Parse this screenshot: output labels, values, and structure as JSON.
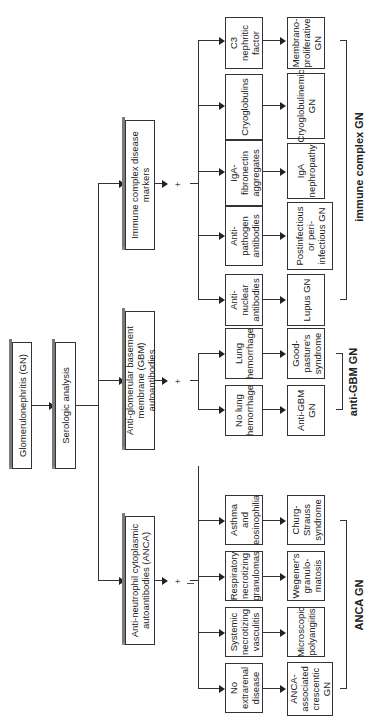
{
  "root": {
    "label": "Glomerulonephritis (GN)"
  },
  "step": {
    "label": "Serologic analysis"
  },
  "categories": [
    {
      "label": "Anti-neutrophil cytoplasmic autoantibodies (ANCA)"
    },
    {
      "label": "Anti-glomerular basement membrane (GBM) autoantibodies"
    },
    {
      "label": "Immune complex disease markers"
    }
  ],
  "plus_symbol": "+",
  "anca": {
    "findings": [
      "No extrarenal disease",
      "Systemic necrotizing vasculitis",
      "Respiratory necrotizing granulomas",
      "Asthma and eosinophilia"
    ],
    "diagnoses": [
      "ANCA-associated crescentic GN",
      "Microscopic polyangiitis",
      "Wegener's granulo-matosis",
      "Churg-Strauss syndrome"
    ],
    "group_label": "ANCA GN"
  },
  "gbm": {
    "findings": [
      "No lung hemorrhage",
      "Lung hemorrhage"
    ],
    "diagnoses": [
      "Anti-GBM GN",
      "Good-pasture's syndrome"
    ],
    "group_label": "anti-GBM GN"
  },
  "immune": {
    "findings": [
      "Anti-nuclear antibodies",
      "Anti-pathogen antibodies",
      "IgA-fibronectin aggregates",
      "Cryoglobulins",
      "C3 nephritic factor"
    ],
    "diagnoses": [
      "Lupus GN",
      "Postinfectious or peri-infectious GN",
      "IgA nephropathy",
      "Cryoglobulinemic GN",
      "Membrano-proliferative GN"
    ],
    "group_label": "immune complex GN"
  }
}
